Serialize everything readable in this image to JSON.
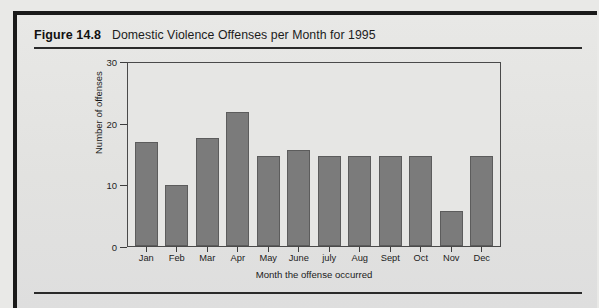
{
  "figure": {
    "number": "Figure 14.8",
    "title": "Domestic Violence Offenses per Month for 1995"
  },
  "colors": {
    "bar_fill": "#7b7b7b",
    "bar_edge": "#5c5c5c",
    "frame": "#4a4a4a",
    "page_background": "#e4e4e2",
    "rule": "#2a2a2a"
  },
  "chart_data": {
    "type": "bar",
    "title": "Domestic Violence Offenses per Month for 1995",
    "xlabel": "Month the offense occurred",
    "ylabel": "Number of offenses",
    "categories": [
      "Jan",
      "Feb",
      "Mar",
      "Apr",
      "May",
      "June",
      "july",
      "Aug",
      "Sept",
      "Oct",
      "Nov",
      "Dec"
    ],
    "values": [
      17,
      10,
      17.7,
      22,
      14.8,
      15.7,
      14.7,
      14.7,
      14.7,
      14.7,
      5.8,
      14.7
    ],
    "ylim": [
      0,
      30
    ],
    "yticks": [
      0,
      10,
      20,
      30
    ],
    "ytick_labels": [
      "0",
      "10",
      "20",
      "30"
    ],
    "grid": false,
    "legend": null
  }
}
